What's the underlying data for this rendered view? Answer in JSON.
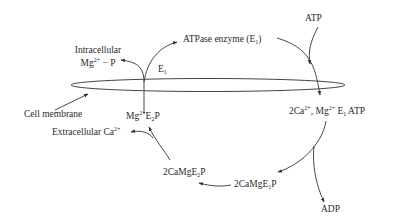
{
  "diagram": {
    "labels": {
      "atp": "ATP",
      "atpase_enzyme": [
        "ATPase enzyme (E",
        "1",
        ")"
      ],
      "intracellular": "Intracellular",
      "mg_p": [
        "Mg",
        "2+",
        " − P"
      ],
      "e1": [
        "E",
        "1"
      ],
      "cell_membrane": "Cell membrane",
      "mg_e2p": [
        "Mg",
        "2+",
        "E",
        "2",
        "P"
      ],
      "extracellular_ca": [
        "Extracellular Ca",
        "2+"
      ],
      "ca_mg_e1_atp": [
        "2Ca",
        "2+",
        ", Mg",
        "2+",
        " E",
        "1",
        " ATP"
      ],
      "ca_mg_e1p": [
        "2CaMgE",
        "1",
        "P"
      ],
      "ca_mg_e2p": [
        "2CaMgE",
        "2",
        "P"
      ],
      "adp": "ADP"
    },
    "colors": {
      "line": "#333333",
      "text": "#2a2a2a",
      "background": "#ffffff"
    }
  }
}
